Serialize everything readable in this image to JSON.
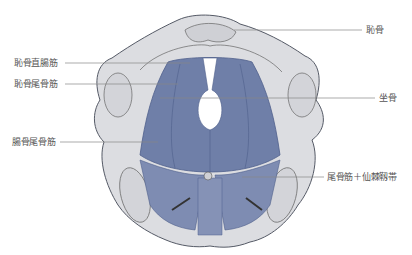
{
  "labels": {
    "pubis": "恥骨",
    "puborectalis": "恥骨直腸筋",
    "pubococcygeus": "恥骨尾骨筋",
    "ischium": "坐骨",
    "iliococcygeus": "腸骨尾骨筋",
    "coccygeus_sacrospinous": "尾骨筋＋仙棘靱帯"
  },
  "colors": {
    "muscle": "#6f7fa8",
    "muscle_dark": "#4f5f8c",
    "bone": "#dcdde1",
    "bone_outline": "#555a66",
    "leader_line": "#888888",
    "text": "#555555"
  }
}
